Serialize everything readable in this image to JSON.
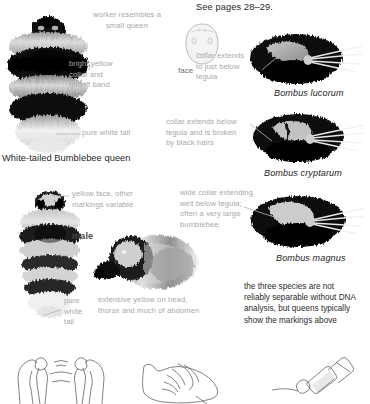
{
  "page": {
    "header": "See pages 28–29.",
    "accent_grey": "#a8a8a8",
    "text_color": "#262626"
  },
  "queen_panel": {
    "note_worker": "worker resembles a\nsmall queen",
    "note_collar": "bright yellow\ncollar and\nmidriff band",
    "note_tail": "pure white tail",
    "caption": "White-tailed Bumblebee queen",
    "image_name": "white-tailed-bumblebee-queen-photo"
  },
  "face_panel": {
    "label": "face",
    "image_name": "bee-face-diagram"
  },
  "species": [
    {
      "name": "Bombus lucorum",
      "note": "collar extends\nto just below\ntegula",
      "image_name": "bombus-lucorum-thorax-photo"
    },
    {
      "name": "Bombus cryptarum",
      "note": "collar extends below\ntegula and is broken\nby black hairs",
      "image_name": "bombus-cryptarum-thorax-photo"
    },
    {
      "name": "Bombus magnus",
      "note": "wide collar extending\nwell below tegula;\noften a very large\nbumblebee.",
      "image_name": "bombus-magnus-thorax-photo"
    }
  ],
  "male_panel": {
    "note_face": "yellow face, other\nmarkings variable",
    "label": "male",
    "note_tail": "pure\nwhite\ntail",
    "note_side": "extensive yellow on head,\nthorax and much of abdomen",
    "image_name": "male-bumblebee-dorsal-photo",
    "side_image_name": "male-bumblebee-lateral-photo"
  },
  "summary": {
    "text": "the three species are not\nreliably separable without DNA\nanalysis, but queens typically\nshow the markings above"
  },
  "bottom_figures": [
    {
      "name": "genitalia-line-drawing"
    },
    {
      "name": "gonostylus-line-drawing"
    },
    {
      "name": "antenna-segment-line-drawing"
    }
  ]
}
